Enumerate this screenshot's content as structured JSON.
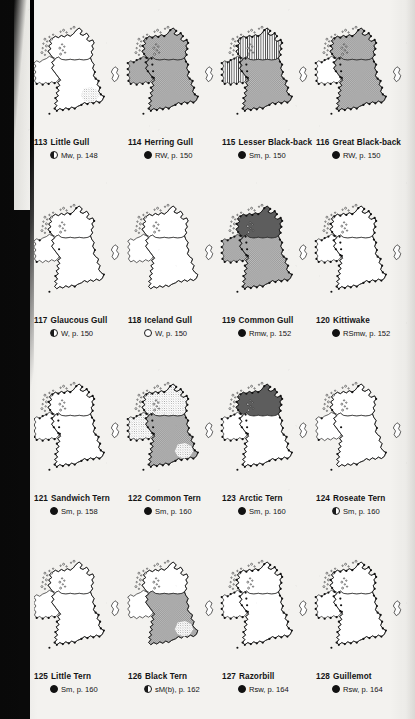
{
  "page": {
    "kind": "field-guide distribution map plate",
    "background_color": "#f3f2ef",
    "ink_color": "#141414",
    "gutter_color": "#0a0a0a"
  },
  "legend_symbols": {
    "filled": "●",
    "open": "○",
    "half": "◐"
  },
  "maps": [
    {
      "number": "113",
      "name": "Little Gull",
      "symbol": "half",
      "status": "Mw",
      "page_ref": "p. 148",
      "shading": {
        "ireland": "none",
        "britain_n": "none",
        "britain_s": "none",
        "scotland_solid": false,
        "coast_dots": "east-south",
        "dot_tone": "light",
        "se_patch": true
      }
    },
    {
      "number": "114",
      "name": "Herring Gull",
      "symbol": "filled",
      "status": "RW",
      "page_ref": "p. 150",
      "shading": {
        "ireland": "dots",
        "britain_n": "dots",
        "britain_s": "dots",
        "scotland_solid": false,
        "coast_dots": "all",
        "dot_tone": "medium",
        "se_patch": false
      }
    },
    {
      "number": "115",
      "name": "Lesser Black-back",
      "symbol": "filled",
      "status": "Sm",
      "page_ref": "p. 150",
      "shading": {
        "ireland": "lines",
        "britain_n": "lines",
        "britain_s": "dots",
        "scotland_solid": false,
        "coast_dots": "all",
        "dot_tone": "medium",
        "se_patch": false
      }
    },
    {
      "number": "116",
      "name": "Great Black-back",
      "symbol": "filled",
      "status": "RW",
      "page_ref": "p. 150",
      "shading": {
        "ireland": "none",
        "britain_n": "dots",
        "britain_s": "dots",
        "scotland_solid": false,
        "coast_dots": "all",
        "dot_tone": "medium",
        "se_patch": false
      }
    },
    {
      "number": "117",
      "name": "Glaucous Gull",
      "symbol": "half",
      "status": "W",
      "page_ref": "p. 150",
      "shading": {
        "ireland": "none",
        "britain_n": "none",
        "britain_s": "none",
        "scotland_solid": false,
        "coast_dots": "sparse",
        "dot_tone": "light",
        "se_patch": false
      }
    },
    {
      "number": "118",
      "name": "Iceland Gull",
      "symbol": "open",
      "status": "W",
      "page_ref": "p. 150",
      "shading": {
        "ireland": "none",
        "britain_n": "none",
        "britain_s": "none",
        "scotland_solid": false,
        "coast_dots": "none",
        "dot_tone": "light",
        "se_patch": false
      }
    },
    {
      "number": "119",
      "name": "Common Gull",
      "symbol": "filled",
      "status": "Rmw",
      "page_ref": "p. 152",
      "shading": {
        "ireland": "dots",
        "britain_n": "dots",
        "britain_s": "dots",
        "scotland_solid": true,
        "coast_dots": "all",
        "dot_tone": "medium",
        "se_patch": false
      }
    },
    {
      "number": "120",
      "name": "Kittiwake",
      "symbol": "filled",
      "status": "RSmw",
      "page_ref": "p. 152",
      "shading": {
        "ireland": "none",
        "britain_n": "none",
        "britain_s": "none",
        "scotland_solid": false,
        "coast_dots": "all",
        "dot_tone": "light",
        "se_patch": false
      }
    },
    {
      "number": "121",
      "name": "Sandwich Tern",
      "symbol": "filled",
      "status": "Sm",
      "page_ref": "p. 158",
      "shading": {
        "ireland": "none",
        "britain_n": "none",
        "britain_s": "none",
        "scotland_solid": false,
        "coast_dots": "all",
        "dot_tone": "light",
        "se_patch": false
      }
    },
    {
      "number": "122",
      "name": "Common Tern",
      "symbol": "filled",
      "status": "Sm",
      "page_ref": "p. 160",
      "shading": {
        "ireland": "light",
        "britain_n": "light",
        "britain_s": "dots",
        "scotland_solid": false,
        "coast_dots": "all",
        "dot_tone": "light",
        "se_patch": true
      }
    },
    {
      "number": "123",
      "name": "Arctic Tern",
      "symbol": "filled",
      "status": "Sm",
      "page_ref": "p. 160",
      "shading": {
        "ireland": "none",
        "britain_n": "dots",
        "britain_s": "none",
        "scotland_solid": true,
        "coast_dots": "all",
        "dot_tone": "light",
        "se_patch": false
      }
    },
    {
      "number": "124",
      "name": "Roseate Tern",
      "symbol": "half",
      "status": "Sm",
      "page_ref": "p. 160",
      "shading": {
        "ireland": "none",
        "britain_n": "none",
        "britain_s": "none",
        "scotland_solid": false,
        "coast_dots": "sparse",
        "dot_tone": "light",
        "se_patch": false
      }
    },
    {
      "number": "125",
      "name": "Little Tern",
      "symbol": "filled",
      "status": "Sm",
      "page_ref": "p. 160",
      "shading": {
        "ireland": "none",
        "britain_n": "none",
        "britain_s": "none",
        "scotland_solid": false,
        "coast_dots": "south-east",
        "dot_tone": "light",
        "se_patch": false
      }
    },
    {
      "number": "126",
      "name": "Black Tern",
      "symbol": "half",
      "status": "sM(b)",
      "page_ref": "p. 162",
      "shading": {
        "ireland": "none",
        "britain_n": "none",
        "britain_s": "dots",
        "scotland_solid": false,
        "coast_dots": "none",
        "dot_tone": "light",
        "se_patch": true
      }
    },
    {
      "number": "127",
      "name": "Razorbill",
      "symbol": "filled",
      "status": "Rsw",
      "page_ref": "p. 164",
      "shading": {
        "ireland": "none",
        "britain_n": "none",
        "britain_s": "none",
        "scotland_solid": false,
        "coast_dots": "all",
        "dot_tone": "light",
        "se_patch": false
      }
    },
    {
      "number": "128",
      "name": "Guillemot",
      "symbol": "filled",
      "status": "Rsw",
      "page_ref": "p. 164",
      "shading": {
        "ireland": "none",
        "britain_n": "none",
        "britain_s": "none",
        "scotland_solid": false,
        "coast_dots": "all",
        "dot_tone": "light",
        "se_patch": false
      }
    }
  ]
}
